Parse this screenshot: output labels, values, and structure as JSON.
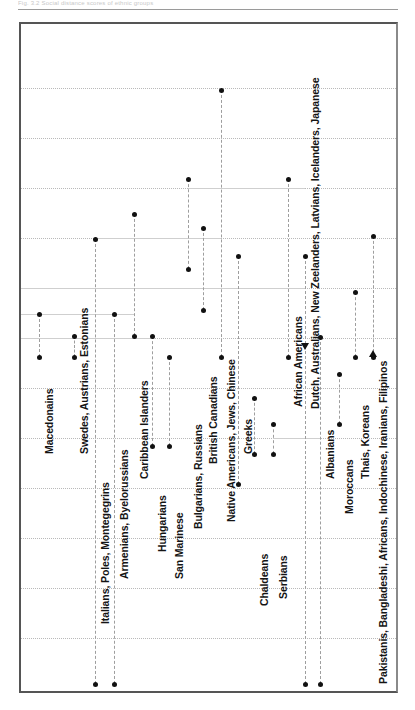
{
  "page": {
    "running_head": "Fig. 3.2  Social distance scores of ethnic groups",
    "background_color": "#ffffff",
    "marker_color": "#111111",
    "grid_color": "#b9b9b9"
  },
  "chart_data": {
    "type": "scatter",
    "title": "",
    "subtitle": "",
    "xlabel": "",
    "ylabel": "",
    "grid": true,
    "legend_position": "none",
    "xlim": [
      0,
      375
    ],
    "ylim": [
      0,
      667
    ],
    "gridline_y": [
      64,
      114,
      164,
      214,
      264,
      314,
      364,
      414,
      464,
      514,
      564,
      614
    ],
    "axis_note": "Category names are printed as rotated labels inside the plot; each category is a dashed vertical stem joining its marker pair.",
    "categories": [
      "Macedonains",
      "Swedes, Austrians, Estonians",
      "Italians, Poles, Montegegrins",
      "Armenians, Byelorussians",
      "Caribbean Islanders",
      "Hungarians",
      "San Marinese",
      "Bulgarians, Russians",
      "British Canadians",
      "Native Americans, Jews, Chinese",
      "Greeks",
      "Chaldeans",
      "Serbians",
      "African Americans",
      "Dutch, Australians, New Zeelanders, Latvians, Icelanders, Japanese",
      "Albanians",
      "Moroccans",
      "Thais, Koreans",
      "Pakistanis, Bangladeshi, Africans, Indochinese, Iranians, Filipinos"
    ],
    "series": [
      {
        "name": "upper marker",
        "marker": "dot",
        "x": [
          18,
          53,
          74,
          93,
          113,
          131,
          148,
          167,
          182,
          200,
          217,
          233,
          252,
          267,
          284,
          299,
          318,
          334,
          352
        ],
        "values": [
          290,
          312,
          215,
          290,
          190,
          312,
          333,
          155,
          204,
          66,
          232,
          374,
          400,
          155,
          232,
          313,
          350,
          268,
          212
        ]
      },
      {
        "name": "lower marker",
        "marker": "dot",
        "x": [
          18,
          53,
          74,
          93,
          113,
          131,
          148,
          167,
          182,
          200,
          217,
          233,
          252,
          267,
          284,
          299,
          318,
          334,
          352
        ],
        "values": [
          333,
          333,
          422,
          660,
          312,
          422,
          422,
          245,
          286,
          333,
          460,
          430,
          430,
          333,
          660,
          660,
          400,
          333,
          333
        ]
      }
    ],
    "special_markers": [
      {
        "label": "Dutch, Australians, New Zeelanders, Latvians, Icelanders, Japanese",
        "glyph": "triangle-down",
        "x": 284,
        "y": 322
      },
      {
        "label": "Pakistanis, Bangladeshi, Africans, Indochinese, Iranians, Filipinos",
        "glyph": "triangle-up",
        "x": 352,
        "y": 330
      }
    ],
    "points": [
      {
        "cat": "Macedonains",
        "x": 18,
        "top": 290,
        "bottom": 333,
        "label_y": 430,
        "label_size": 10.5
      },
      {
        "cat": "Swedes, Austrians, Estonians",
        "x": 53,
        "top": 312,
        "bottom": 333,
        "label_y": 430,
        "label_size": 10.5
      },
      {
        "cat": "Italians, Poles, Montegegrins",
        "x": 74,
        "top": 215,
        "bottom": 660,
        "label_y": 600,
        "label_size": 10.5
      },
      {
        "cat": "Armenians, Byelorussians",
        "x": 93,
        "top": 290,
        "bottom": 660,
        "label_y": 555,
        "label_size": 10.5
      },
      {
        "cat": "Caribbean Islanders",
        "x": 113,
        "top": 190,
        "bottom": 312,
        "label_y": 455,
        "label_size": 10.5
      },
      {
        "cat": "Hungarians",
        "x": 131,
        "top": 312,
        "bottom": 422,
        "label_y": 528,
        "label_size": 10.5
      },
      {
        "cat": "San Marinese",
        "x": 148,
        "top": 333,
        "bottom": 422,
        "label_y": 555,
        "label_size": 10.5
      },
      {
        "cat": "Bulgarians, Russians",
        "x": 167,
        "top": 155,
        "bottom": 245,
        "label_y": 505,
        "label_size": 10.5
      },
      {
        "cat": "British Canadians",
        "x": 182,
        "top": 204,
        "bottom": 286,
        "label_y": 440,
        "label_size": 10.5
      },
      {
        "cat": "Native Americans, Jews, Chinese",
        "x": 200,
        "top": 66,
        "bottom": 333,
        "label_y": 498,
        "label_size": 10.5
      },
      {
        "cat": "Greeks",
        "x": 217,
        "top": 232,
        "bottom": 460,
        "label_y": 430,
        "label_size": 10.5
      },
      {
        "cat": "Chaldeans",
        "x": 233,
        "top": 374,
        "bottom": 430,
        "label_y": 582,
        "label_size": 10.5
      },
      {
        "cat": "Serbians",
        "x": 252,
        "top": 400,
        "bottom": 430,
        "label_y": 575,
        "label_size": 10.5
      },
      {
        "cat": "African Americans",
        "x": 267,
        "top": 155,
        "bottom": 333,
        "label_y": 383,
        "label_size": 10.5
      },
      {
        "cat": "Dutch, Australians, New Zeelanders, Latvians, Icelanders, Japanese",
        "x": 284,
        "top": 232,
        "bottom": 660,
        "label_y": 385,
        "label_size": 10.5
      },
      {
        "cat": "Albanians",
        "x": 299,
        "top": 313,
        "bottom": 660,
        "label_y": 455,
        "label_size": 10.5
      },
      {
        "cat": "Moroccans",
        "x": 318,
        "top": 350,
        "bottom": 400,
        "label_y": 490,
        "label_size": 10.5
      },
      {
        "cat": "Thais, Koreans",
        "x": 334,
        "top": 268,
        "bottom": 333,
        "label_y": 455,
        "label_size": 10.5
      },
      {
        "cat": "Pakistanis, Bangladeshi, Africans, Indochinese, Iranians, Filipinos",
        "x": 352,
        "top": 212,
        "bottom": 333,
        "label_y": 660,
        "label_size": 10.5
      }
    ],
    "connector_segments": [
      {
        "x1": 0,
        "x2": 200,
        "y": 264
      },
      {
        "x1": 0,
        "x2": 113,
        "y": 290
      },
      {
        "x1": 74,
        "x2": 200,
        "y": 214
      },
      {
        "x1": 167,
        "x2": 284,
        "y": 164
      },
      {
        "x1": 252,
        "x2": 299,
        "y": 414
      },
      {
        "x1": 0,
        "x2": 131,
        "y": 314
      },
      {
        "x1": 182,
        "x2": 284,
        "y": 264
      }
    ]
  }
}
